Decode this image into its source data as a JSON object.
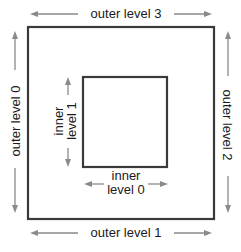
{
  "diagram": {
    "colors": {
      "box_stroke": "#3a3a3a",
      "arrow": "#8a8a8a",
      "text": "#1a1a1a",
      "background": "#ffffff"
    },
    "outer_box": {
      "x": 28,
      "y": 26,
      "width": 186,
      "height": 193
    },
    "inner_box": {
      "x": 82,
      "y": 77,
      "width": 85,
      "height": 90
    },
    "labels": {
      "outer_level_3": "outer level 3",
      "outer_level_0": "outer level 0",
      "outer_level_2": "outer level 2",
      "outer_level_1": "outer level 1",
      "inner_level_1_line1": "inner",
      "inner_level_1_line2": "level 1",
      "inner_level_0_line1": "inner",
      "inner_level_0_line2": "level 0"
    }
  }
}
